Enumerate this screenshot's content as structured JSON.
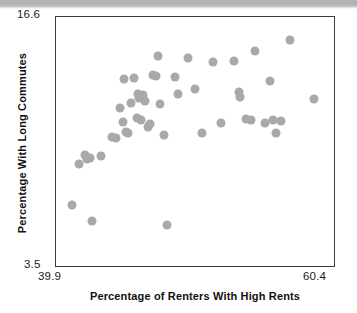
{
  "chart_data": {
    "type": "scatter",
    "title": "",
    "xlabel": "Percentage of Renters With High Rents",
    "ylabel": "Percentage With Long Commutes",
    "xlim": [
      39.9,
      60.4
    ],
    "ylim": [
      3.5,
      16.6
    ],
    "xticks": [
      "39.9",
      "60.4"
    ],
    "yticks": [
      "3.5",
      "16.6"
    ],
    "grid": false,
    "legend": null,
    "marker_color": "#a9a9a9",
    "frame_color": "#3c3c3c",
    "points": [
      [
        41.1,
        6.8
      ],
      [
        41.6,
        8.95
      ],
      [
        42.0,
        9.4
      ],
      [
        42.2,
        9.2
      ],
      [
        42.4,
        9.25
      ],
      [
        42.5,
        5.95
      ],
      [
        43.2,
        9.35
      ],
      [
        44.0,
        10.35
      ],
      [
        44.3,
        10.3
      ],
      [
        44.6,
        11.85
      ],
      [
        44.8,
        11.1
      ],
      [
        44.9,
        13.35
      ],
      [
        45.0,
        10.6
      ],
      [
        45.2,
        10.55
      ],
      [
        45.4,
        12.1
      ],
      [
        45.6,
        13.4
      ],
      [
        45.8,
        11.35
      ],
      [
        45.9,
        12.6
      ],
      [
        46.0,
        12.35
      ],
      [
        46.1,
        11.25
      ],
      [
        46.3,
        12.55
      ],
      [
        46.4,
        12.2
      ],
      [
        46.6,
        10.85
      ],
      [
        46.8,
        11.0
      ],
      [
        47.0,
        13.55
      ],
      [
        47.2,
        13.5
      ],
      [
        47.4,
        14.55
      ],
      [
        47.5,
        12.05
      ],
      [
        47.8,
        10.45
      ],
      [
        48.0,
        5.75
      ],
      [
        48.6,
        13.45
      ],
      [
        48.8,
        12.6
      ],
      [
        49.6,
        14.45
      ],
      [
        50.1,
        12.85
      ],
      [
        50.6,
        10.55
      ],
      [
        51.4,
        14.25
      ],
      [
        52.0,
        11.05
      ],
      [
        52.9,
        14.3
      ],
      [
        53.3,
        12.7
      ],
      [
        53.4,
        12.45
      ],
      [
        53.8,
        11.3
      ],
      [
        54.2,
        11.25
      ],
      [
        54.5,
        14.85
      ],
      [
        55.2,
        11.05
      ],
      [
        55.6,
        13.25
      ],
      [
        55.8,
        11.2
      ],
      [
        56.0,
        10.55
      ],
      [
        56.4,
        11.15
      ],
      [
        57.0,
        15.4
      ],
      [
        58.8,
        12.3
      ]
    ]
  }
}
